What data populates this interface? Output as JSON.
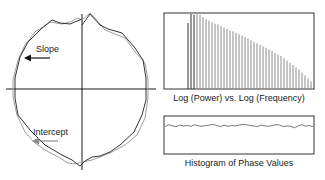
{
  "polar_plot": {
    "labels": {
      "slope": "Slope",
      "intercept": "Intercept"
    },
    "colors": {
      "axes": "#1a1a1a",
      "dark_curve": "#333333",
      "light_curve": "#9a9a9a",
      "slope_arrow": "#111111",
      "intercept_arrow": "#8a8a8a"
    }
  },
  "chart_data": [
    {
      "type": "bar",
      "title": "Log (Power) vs. Log (Frequency)",
      "xlabel": "Log (Frequency)",
      "ylabel": "Log (Power)",
      "grid": false,
      "ylim": [
        0,
        1
      ],
      "bar_count": 42,
      "values": [
        0.88,
        1.0,
        0.99,
        1.0,
        0.99,
        0.96,
        0.93,
        0.91,
        0.89,
        0.87,
        0.86,
        0.84,
        0.82,
        0.8,
        0.78,
        0.77,
        0.75,
        0.73,
        0.71,
        0.69,
        0.67,
        0.65,
        0.63,
        0.61,
        0.59,
        0.57,
        0.55,
        0.53,
        0.51,
        0.48,
        0.46,
        0.44,
        0.41,
        0.38,
        0.35,
        0.32,
        0.29,
        0.26,
        0.22,
        0.18,
        0.14,
        0.1
      ],
      "colors": {
        "first_bars": "#333333",
        "bars": "#8c8c8c",
        "frame": "#333333"
      }
    },
    {
      "type": "line",
      "title": "Histogram of Phase Values",
      "grid": false,
      "ylim": [
        0,
        1
      ],
      "values": [
        0.72,
        0.77,
        0.74,
        0.72,
        0.76,
        0.74,
        0.75,
        0.73,
        0.77,
        0.74,
        0.73,
        0.75,
        0.76,
        0.78,
        0.75,
        0.72,
        0.76,
        0.73,
        0.75,
        0.74,
        0.76,
        0.78,
        0.77,
        0.75,
        0.74,
        0.72,
        0.76,
        0.74,
        0.73,
        0.75,
        0.77,
        0.76,
        0.72,
        0.74,
        0.73,
        0.69,
        0.74,
        0.77,
        0.73,
        0.75,
        0.72
      ],
      "colors": {
        "line": "#777777",
        "frame": "#333333"
      }
    }
  ]
}
